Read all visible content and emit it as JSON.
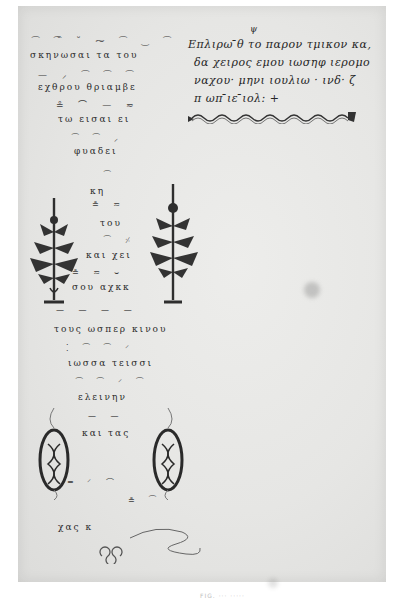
{
  "document": {
    "type": "Byzantine neumatic music manuscript page (scan)",
    "left_column": {
      "neume_rows": [
        "⁀ ⁀̆ ˘ ⁓  ⁀ ‿ ⁀",
        "— ⸝  ⁀ ⁀ ⁀",
        "≗ ⌒ — ≂",
        "⁀ ⁀ ⸝",
        "⁀",
        "≗ ≂",
        "⁀ ⸓",
        "≗ ≂ ⌣",
        "— — — —",
        "⁚ ⁀ ⁀ ⸍",
        "⁀ ⁀ ⸍ ⁀",
        "— —",
        "═ ⸍ ⌒",
        "≗ ⁀"
      ],
      "text_lines": [
        "σκηνωσαι τα         του",
        "εχθρου θριαμβε",
        "τω      εισαι ει",
        "φυαδει",
        "κη",
        "του",
        "και χει",
        "σου αχκκ",
        "τους ωσπερ κινου",
        "ιωσσα   τεισσι",
        "ελεινην",
        "και  τας",
        "χας   κ"
      ]
    },
    "colophon": {
      "lines": [
        "Επλιρω ̄θ το παρον τμικον κα,",
        "δα χειρος εμου ιωσηφ ιερομο",
        "ναχου· μηνι ιουλιω · ινδ· ζ",
        "π ωπ  ̄ιε  ̄ιολ:  +"
      ],
      "superscript": "ψ"
    },
    "ornaments": [
      {
        "name": "plant-ornament-left"
      },
      {
        "name": "plant-ornament-right"
      },
      {
        "name": "cartouche-left"
      },
      {
        "name": "cartouche-right"
      },
      {
        "name": "wavy-line-ornament"
      },
      {
        "name": "knot-ornament"
      }
    ],
    "caption": "FIG. ···  ·····"
  }
}
